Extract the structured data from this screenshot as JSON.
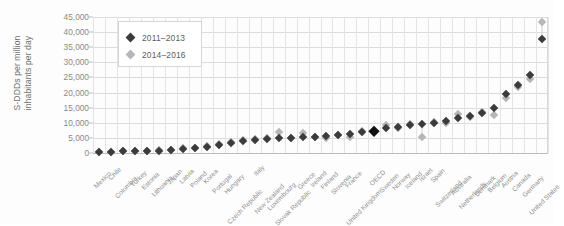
{
  "chart_data": {
    "type": "scatter",
    "title": "",
    "xlabel": "",
    "ylabel": "S-DDDs per million\ninhabitants per day",
    "ylim": [
      0,
      45000
    ],
    "ytick_labels": [
      "0",
      "5,000",
      "10,000",
      "15,000",
      "20,000",
      "25,000",
      "30,000",
      "35,000",
      "40,000",
      "45,000"
    ],
    "ytick_values": [
      0,
      5000,
      10000,
      15000,
      20000,
      25000,
      30000,
      35000,
      40000,
      45000
    ],
    "grid": true,
    "legend_position": "top-left",
    "categories": [
      "Mexico",
      "Chile",
      "Colombia",
      "Turkey",
      "Estonia",
      "Lithuania",
      "Japan",
      "Latvia",
      "Poland",
      "Korea",
      "Portugal",
      "Hungary",
      "Czech Republic",
      "Italy",
      "New Zealand",
      "Luxembourg",
      "Slovak Republic",
      "Greece",
      "Ireland",
      "Finland",
      "Slovenia",
      "France",
      "United Kingdom",
      "OECD",
      "Sweden",
      "Norway",
      "Iceland",
      "Israel",
      "Spain",
      "Switzerland",
      "Australia",
      "Netherlands",
      "Denmark",
      "Belgium",
      "Austria",
      "Canada",
      "Germany",
      "United States"
    ],
    "series": [
      {
        "name": "2011–2013",
        "color": "#3b3b3b",
        "values": [
          300,
          400,
          500,
          600,
          700,
          800,
          1000,
          1300,
          1600,
          2000,
          2600,
          3300,
          4000,
          4300,
          4600,
          4800,
          5000,
          5200,
          5400,
          5600,
          5900,
          6300,
          7000,
          7400,
          8200,
          8600,
          9100,
          9500,
          9900,
          10600,
          11600,
          12400,
          13100,
          14900,
          19500,
          22400,
          25900,
          37800
        ]
      },
      {
        "name": "2014–2016",
        "color": "#b6b6b6",
        "values": [
          350,
          450,
          600,
          700,
          800,
          900,
          1100,
          1500,
          1800,
          2300,
          2900,
          3600,
          4200,
          4500,
          4800,
          6900,
          5000,
          6600,
          5200,
          5000,
          6100,
          5400,
          7300,
          7400,
          9100,
          8200,
          9600,
          5300,
          10300,
          9900,
          12900,
          11900,
          13700,
          12600,
          18100,
          21900,
          24400,
          43200
        ]
      }
    ]
  },
  "legend": {
    "items": [
      {
        "label": "2011–2013",
        "color": "#3b3b3b"
      },
      {
        "label": "2014–2016",
        "color": "#b6b6b6"
      }
    ]
  }
}
